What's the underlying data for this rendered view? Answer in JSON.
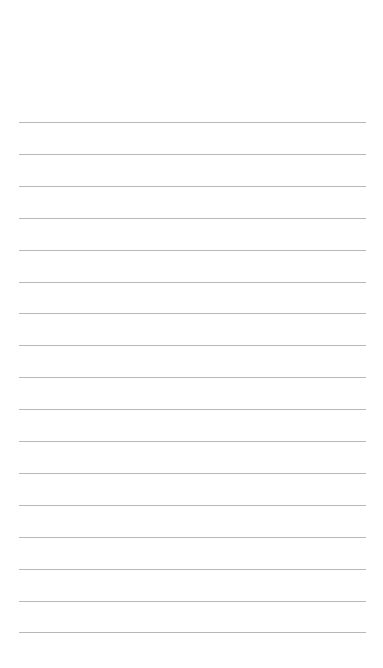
{
  "page": {
    "title": "",
    "background": "#ffffff",
    "rule_color": "#b8b8b8"
  },
  "ruled_lines": {
    "count": 17,
    "first_y": 122,
    "spacing": 31.9
  }
}
